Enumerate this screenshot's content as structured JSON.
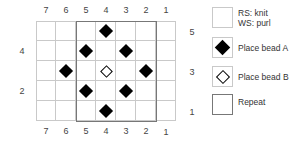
{
  "chart": {
    "columns_top": [
      "7",
      "6",
      "5",
      "4",
      "3",
      "2",
      "1"
    ],
    "columns_bottom": [
      "7",
      "6",
      "5",
      "4",
      "3",
      "2",
      "1"
    ],
    "rows_left": [
      {
        "label": "4",
        "row": 4
      },
      {
        "label": "2",
        "row": 2
      }
    ],
    "rows_right": [
      {
        "label": "5",
        "row": 5
      },
      {
        "label": "3",
        "row": 3
      },
      {
        "label": "1",
        "row": 1
      }
    ],
    "num_columns": 7,
    "num_rows": 5,
    "repeat": {
      "from_column": 5,
      "to_column": 2
    },
    "beads": [
      {
        "row": 5,
        "column": 4,
        "type": "A"
      },
      {
        "row": 4,
        "column": 5,
        "type": "A"
      },
      {
        "row": 4,
        "column": 3,
        "type": "A"
      },
      {
        "row": 3,
        "column": 6,
        "type": "A"
      },
      {
        "row": 3,
        "column": 4,
        "type": "B"
      },
      {
        "row": 3,
        "column": 2,
        "type": "A"
      },
      {
        "row": 2,
        "column": 5,
        "type": "A"
      },
      {
        "row": 2,
        "column": 3,
        "type": "A"
      },
      {
        "row": 1,
        "column": 4,
        "type": "A"
      }
    ]
  },
  "legend": [
    {
      "symbol": "blank-square",
      "label": "RS: knit\nWS: purl"
    },
    {
      "symbol": "filled-diamond",
      "label": "Place bead A"
    },
    {
      "symbol": "outline-diamond",
      "label": "Place bead B"
    },
    {
      "symbol": "repeat-box",
      "label": "Repeat"
    }
  ],
  "colors": {
    "grid": "#c9c9c9",
    "repeat_border": "#777777",
    "bead_a": "#000000",
    "bead_b_outline": "#000000"
  }
}
